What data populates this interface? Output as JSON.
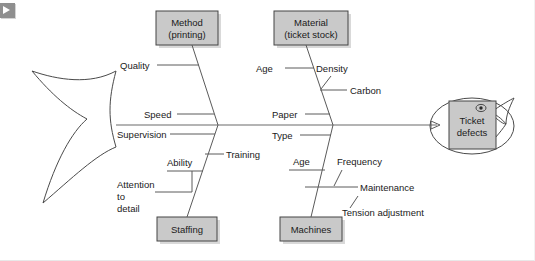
{
  "nav": {
    "back_button_icon": "play-right-icon",
    "back_button_label": ""
  },
  "diagram": {
    "type": "fishbone-ishikawa",
    "effect": {
      "label_line1": "Ticket",
      "label_line2": "defects",
      "eye_icon": "fish-eye-icon"
    },
    "categories": [
      {
        "id": "method",
        "label_line1": "Method",
        "label_line2": "(printing)",
        "position": "top-left",
        "causes": [
          "Quality",
          "Speed"
        ]
      },
      {
        "id": "material",
        "label_line1": "Material",
        "label_line2": "(ticket stock)",
        "position": "top-right",
        "causes": [
          "Age",
          "Density",
          "Carbon",
          "Paper"
        ]
      },
      {
        "id": "staffing",
        "label_line1": "Staffing",
        "label_line2": "",
        "position": "bottom-left",
        "causes": [
          "Supervision",
          "Training",
          "Ability",
          "Attention",
          "to",
          "detail"
        ]
      },
      {
        "id": "machines",
        "label_line1": "Machines",
        "label_line2": "",
        "position": "bottom-right",
        "causes": [
          "Type",
          "Age",
          "Frequency",
          "Maintenance",
          "Tension adjustment"
        ]
      }
    ],
    "labels": {
      "quality": "Quality",
      "speed": "Speed",
      "supervision": "Supervision",
      "training": "Training",
      "ability": "Ability",
      "attention": "Attention",
      "to": "to",
      "detail": "detail",
      "age_material": "Age",
      "density": "Density",
      "carbon": "Carbon",
      "paper": "Paper",
      "type": "Type",
      "age_machines": "Age",
      "frequency": "Frequency",
      "maintenance": "Maintenance",
      "tension_adjustment": "Tension adjustment"
    },
    "colors": {
      "box_fill": "#c9c9c9",
      "box_stroke": "#444444",
      "bone_stroke": "#5a5a5a",
      "text": "#1a1a1a",
      "background": "#ffffff"
    }
  }
}
